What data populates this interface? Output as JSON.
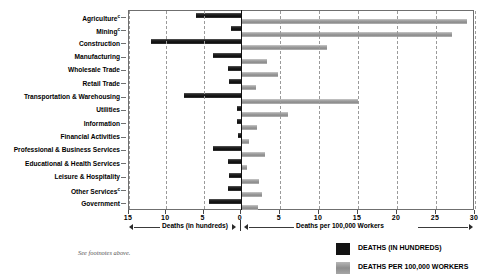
{
  "chart_data": {
    "type": "bar",
    "orientation": "horizontal",
    "title": "",
    "subtitle": "",
    "categories": [
      "Agriculture",
      "Mining",
      "Construction",
      "Manufacturing",
      "Wholesale Trade",
      "Retail Trade",
      "Transportation & Warehousing",
      "Utilities",
      "Information",
      "Financial Activities",
      "Professional & Business Services",
      "Educational & Health Services",
      "Leisure & Hospitality",
      "Other Services",
      "Government"
    ],
    "category_footnote_marks": [
      "c",
      "c",
      "",
      "",
      "",
      "",
      "",
      "",
      "",
      "",
      "",
      "",
      "",
      "c",
      ""
    ],
    "series": [
      {
        "name": "DEATHS (IN HUNDREDS)",
        "color": "#131313",
        "direction": "left",
        "axis": "left",
        "values": [
          6.0,
          1.4,
          12.0,
          3.8,
          1.7,
          1.6,
          7.6,
          0.5,
          0.5,
          0.4,
          3.8,
          1.7,
          1.6,
          1.8,
          4.3
        ]
      },
      {
        "name": "DEATHS PER 100,000 WORKERS",
        "color": "#9a9a9a",
        "direction": "right",
        "axis": "right",
        "values": [
          29.0,
          27.0,
          11.0,
          3.3,
          4.7,
          1.9,
          15.0,
          6.0,
          2.0,
          1.0,
          3.1,
          0.8,
          2.3,
          2.7,
          2.2
        ]
      }
    ],
    "left_axis": {
      "label": "Deaths (in hundreds)",
      "ticks": [
        15,
        10,
        5,
        0
      ],
      "tick_labels": [
        "15",
        "10",
        "5",
        "0"
      ],
      "max": 15,
      "direction": "reversed"
    },
    "right_axis": {
      "label": "Deaths per 100,000 Workers",
      "ticks": [
        0,
        5,
        10,
        15,
        20,
        25,
        30
      ],
      "tick_labels": [
        "0",
        "5",
        "10",
        "15",
        "20",
        "25",
        "30"
      ],
      "max": 30
    },
    "grid": "vertical-dashed",
    "legend_position": "bottom-right",
    "legend": [
      "DEATHS (IN HUNDREDS)",
      "DEATHS PER 100,000 WORKERS"
    ]
  },
  "footnote": "See footnotes above."
}
